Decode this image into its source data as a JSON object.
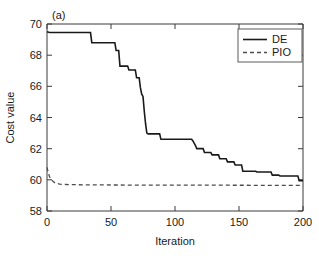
{
  "chart_data": {
    "type": "line",
    "title": "",
    "panel_label": "(a)",
    "xlabel": "Iteration",
    "ylabel": "Cost value",
    "xlim": [
      0,
      200
    ],
    "ylim": [
      58,
      70
    ],
    "xticks": [
      0,
      50,
      100,
      150,
      200
    ],
    "yticks": [
      58,
      60,
      62,
      64,
      66,
      68,
      70
    ],
    "grid": false,
    "legend_position": "top-right",
    "legend": [
      "DE",
      "PIO"
    ],
    "series": [
      {
        "name": "DE",
        "style": "solid",
        "color": "#1a1a1a",
        "step": true,
        "x": [
          0,
          2,
          34,
          35,
          53,
          54,
          56,
          57,
          63,
          64,
          69,
          70,
          72,
          73,
          74,
          75,
          76,
          77,
          78,
          79,
          88,
          89,
          113,
          114,
          116,
          117,
          122,
          123,
          128,
          129,
          134,
          135,
          140,
          141,
          146,
          147,
          152,
          153,
          163,
          164,
          175,
          176,
          181,
          182,
          196,
          197,
          200
        ],
        "y": [
          69.5,
          69.45,
          69.45,
          68.8,
          68.8,
          68.3,
          68.3,
          67.3,
          67.3,
          67.05,
          67.05,
          66.55,
          66.55,
          65.9,
          65.5,
          65.35,
          64.4,
          63.6,
          63.0,
          62.95,
          62.95,
          62.6,
          62.6,
          62.5,
          62.2,
          62.0,
          62.0,
          61.75,
          61.75,
          61.6,
          61.6,
          61.35,
          61.35,
          61.15,
          61.15,
          60.95,
          60.95,
          60.55,
          60.55,
          60.5,
          60.5,
          60.3,
          60.3,
          60.25,
          60.25,
          59.95,
          59.95
        ]
      },
      {
        "name": "PIO",
        "style": "dashed",
        "color": "#4d4d4d",
        "step": false,
        "x": [
          0,
          1,
          2,
          3,
          4,
          5,
          6,
          7,
          8,
          10,
          12,
          15,
          20,
          30,
          50,
          80,
          120,
          160,
          200
        ],
        "y": [
          60.8,
          60.45,
          60.2,
          60.05,
          59.95,
          59.88,
          59.82,
          59.78,
          59.76,
          59.73,
          59.71,
          59.7,
          59.69,
          59.68,
          59.67,
          59.66,
          59.66,
          59.65,
          59.65
        ]
      }
    ]
  },
  "figure": {
    "background_color": "#ffffff",
    "axis_color": "#3a3a3a"
  }
}
